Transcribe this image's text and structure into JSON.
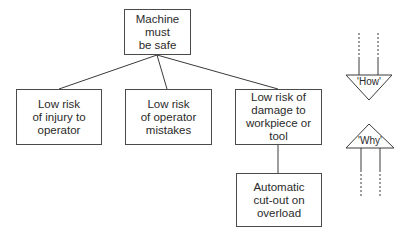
{
  "diagram": {
    "root": {
      "label": "Machine must\nbe safe"
    },
    "children": [
      {
        "label": "Low risk\nof injury to\noperator"
      },
      {
        "label": "Low risk\nof operator\nmistakes"
      },
      {
        "label": "Low risk of\ndamage to\nworkpiece or\ntool"
      }
    ],
    "grandchild": {
      "label": "Automatic\ncut-out on\noverload"
    },
    "arrows": {
      "down": {
        "label": "'How'"
      },
      "up": {
        "label": "'Why'"
      }
    }
  }
}
